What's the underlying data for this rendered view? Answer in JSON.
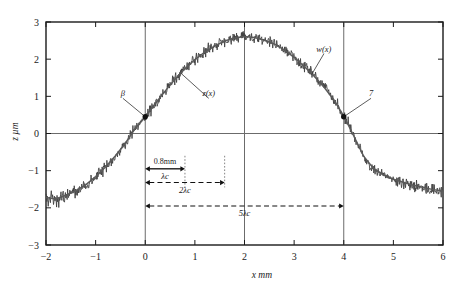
{
  "figure": {
    "title": "",
    "x_axis_label": "x mm",
    "y_axis_label": "z µm"
  },
  "labels": {
    "beta": "β",
    "z_of_x": "z(x)",
    "w_of_x": "w(x)",
    "point_seven": "7",
    "dim_08mm": "0.8mm",
    "dim_lambda_c": "λc",
    "dim_2lambda_c": "2λc",
    "dim_5lambda_c": "5λc"
  },
  "chart_data": {
    "type": "line",
    "title": "",
    "xlabel": "x mm",
    "ylabel": "z µm",
    "xlim": [
      -2,
      6
    ],
    "ylim": [
      -3,
      3
    ],
    "xticks": [
      -2,
      -1,
      0,
      1,
      2,
      3,
      4,
      5,
      6
    ],
    "xticklabels": [
      "−2",
      "−1",
      "0",
      "1",
      "2",
      "3",
      "4",
      "5",
      "6"
    ],
    "yticks": [
      -3,
      -2,
      -1,
      0,
      1,
      2,
      3
    ],
    "yticklabels": [
      "−3",
      "−2",
      "−1",
      "0",
      "1",
      "2",
      "3"
    ],
    "grid": true,
    "gridlines_vertical": [
      0,
      2,
      4
    ],
    "gridlines_horizontal": [
      0
    ],
    "legend": "none",
    "series": [
      {
        "name": "z(x)",
        "description": "measured surface profile with roughness noise",
        "x": [
          -2.0,
          -1.9,
          -1.8,
          -1.7,
          -1.6,
          -1.5,
          -1.4,
          -1.3,
          -1.2,
          -1.1,
          -1.0,
          -0.9,
          -0.8,
          -0.7,
          -0.6,
          -0.5,
          -0.4,
          -0.3,
          -0.2,
          -0.1,
          0.0,
          0.1,
          0.2,
          0.3,
          0.4,
          0.5,
          0.6,
          0.7,
          0.8,
          0.9,
          1.0,
          1.1,
          1.2,
          1.3,
          1.4,
          1.5,
          1.6,
          1.7,
          1.8,
          1.9,
          2.0,
          2.1,
          2.2,
          2.3,
          2.4,
          2.5,
          2.6,
          2.7,
          2.8,
          2.9,
          3.0,
          3.1,
          3.2,
          3.3,
          3.4,
          3.5,
          3.6,
          3.7,
          3.8,
          3.9,
          4.0,
          4.1,
          4.2,
          4.3,
          4.4,
          4.5,
          4.6,
          4.7,
          4.8,
          4.9,
          5.0,
          5.1,
          5.2,
          5.3,
          5.4,
          5.5,
          5.6,
          5.7,
          5.8,
          5.9,
          6.0
        ],
        "y": [
          -1.75,
          -1.8,
          -1.78,
          -1.72,
          -1.68,
          -1.62,
          -1.55,
          -1.48,
          -1.4,
          -1.3,
          -1.18,
          -1.05,
          -0.92,
          -0.78,
          -0.62,
          -0.45,
          -0.26,
          -0.06,
          0.16,
          0.32,
          0.45,
          0.62,
          0.8,
          0.98,
          1.15,
          1.32,
          1.48,
          1.62,
          1.76,
          1.88,
          2.0,
          2.1,
          2.2,
          2.28,
          2.36,
          2.44,
          2.5,
          2.55,
          2.58,
          2.6,
          2.62,
          2.6,
          2.58,
          2.55,
          2.52,
          2.48,
          2.42,
          2.34,
          2.26,
          2.16,
          2.05,
          1.94,
          1.82,
          1.7,
          1.56,
          1.42,
          1.26,
          1.1,
          0.92,
          0.72,
          0.48,
          0.22,
          -0.05,
          -0.35,
          -0.62,
          -0.82,
          -0.95,
          -1.05,
          -1.12,
          -1.18,
          -1.24,
          -1.28,
          -1.32,
          -1.36,
          -1.4,
          -1.44,
          -1.47,
          -1.5,
          -1.52,
          -1.54,
          -1.56
        ]
      },
      {
        "name": "w(x)",
        "description": "waviness profile (smooth mean line)",
        "x": [
          -2.0,
          -1.8,
          -1.6,
          -1.4,
          -1.2,
          -1.0,
          -0.8,
          -0.6,
          -0.4,
          -0.2,
          0.0,
          0.2,
          0.4,
          0.6,
          0.8,
          1.0,
          1.2,
          1.4,
          1.6,
          1.8,
          2.0,
          2.2,
          2.4,
          2.6,
          2.8,
          3.0,
          3.2,
          3.4,
          3.6,
          3.8,
          4.0,
          4.2,
          4.4,
          4.6,
          4.8,
          5.0,
          5.2,
          5.4,
          5.6,
          5.8,
          6.0
        ],
        "y": [
          -1.72,
          -1.76,
          -1.66,
          -1.54,
          -1.38,
          -1.16,
          -0.9,
          -0.6,
          -0.26,
          0.14,
          0.45,
          0.8,
          1.14,
          1.46,
          1.74,
          1.99,
          2.19,
          2.35,
          2.49,
          2.57,
          2.61,
          2.58,
          2.51,
          2.41,
          2.25,
          2.05,
          1.81,
          1.55,
          1.25,
          0.91,
          0.47,
          -0.06,
          -0.61,
          -0.94,
          -1.11,
          -1.23,
          -1.31,
          -1.39,
          -1.45,
          -1.51,
          -1.55
        ]
      }
    ],
    "annotations": [
      {
        "name": "beta",
        "text": "β",
        "point_x": 0.0,
        "point_y": 0.45,
        "label_x": -0.45,
        "label_y": 1.0
      },
      {
        "name": "z-of-x",
        "text": "z(x)",
        "point_x": 0.72,
        "point_y": 1.62,
        "label_x": 1.28,
        "label_y": 1.0
      },
      {
        "name": "w-of-x",
        "text": "w(x)",
        "point_x": 3.35,
        "point_y": 1.58,
        "label_x": 3.6,
        "label_y": 2.2
      },
      {
        "name": "point-7",
        "text": "7",
        "point_x": 4.0,
        "point_y": 0.45,
        "label_x": 4.55,
        "label_y": 1.0
      }
    ],
    "dimension_bars": [
      {
        "name": "lambda-c",
        "label_above": "0.8mm",
        "label_below": "λc",
        "x_start": 0.0,
        "x_end": 0.8,
        "y": -0.95,
        "style": "solid"
      },
      {
        "name": "two-lambda-c",
        "label_below": "2λc",
        "x_start": 0.0,
        "x_end": 1.6,
        "y": -1.32,
        "style": "dashed"
      },
      {
        "name": "five-lambda-c",
        "label_below": "5λc",
        "x_start": 0.0,
        "x_end": 4.0,
        "y": -1.95,
        "style": "dashed"
      }
    ],
    "dotted_verticals": [
      {
        "x": 0.8,
        "y_top": -0.6,
        "y_bottom": -1.45
      },
      {
        "x": 1.6,
        "y_top": -0.6,
        "y_bottom": -1.45
      }
    ]
  }
}
